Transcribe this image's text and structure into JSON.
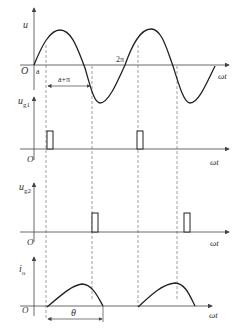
{
  "diagram": {
    "colors": {
      "line": "#222222",
      "axis": "#555555",
      "dash": "#777777"
    },
    "panels": [
      {
        "id": "u",
        "ylabel": "u",
        "xlabel": "ωt",
        "origin": "O",
        "annotations": [
          "a",
          "2π",
          "a+π"
        ]
      },
      {
        "id": "ug1",
        "ylabel": "u",
        "ylabel_sub": "g1",
        "xlabel": "ωt",
        "origin": "O"
      },
      {
        "id": "ug2",
        "ylabel": "u",
        "ylabel_sub": "g2",
        "xlabel": "ωt",
        "origin": "O"
      },
      {
        "id": "io",
        "ylabel": "i",
        "ylabel_sub": "o",
        "xlabel": "ωt",
        "origin": "O",
        "annotations": [
          "θ"
        ]
      }
    ]
  },
  "labels": {
    "u": "u",
    "ug": "u",
    "g1": "g1",
    "g2": "g2",
    "i": "i",
    "o": "o",
    "omega_t": "ωt",
    "origin": "O",
    "alpha": "a",
    "two_pi": "2π",
    "alpha_pi": "a+π",
    "theta": "θ"
  }
}
